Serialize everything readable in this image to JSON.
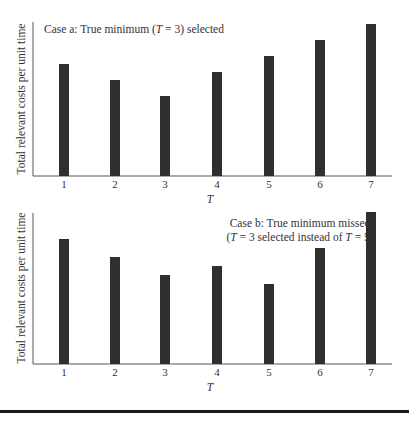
{
  "colors": {
    "bar": "#2f2f2f",
    "axis": "#555555",
    "rule": "#1a1a1a",
    "text": "#333333"
  },
  "chart_data": [
    {
      "type": "bar",
      "title": "Case a: True minimum (T = 3) selected",
      "title_lines": [
        "Case a: True minimum (T = 3) selected"
      ],
      "xlabel": "T",
      "ylabel": "Total relevant costs per unit time",
      "categories": [
        "1",
        "2",
        "3",
        "4",
        "5",
        "6",
        "7"
      ],
      "values": [
        112,
        96,
        80,
        104,
        120,
        136,
        152
      ],
      "ylim": [
        0,
        155
      ],
      "grid": false,
      "yticks": false,
      "note": "Values are relative bar heights (no y-axis scale shown); minimum at T = 3"
    },
    {
      "type": "bar",
      "title": "Case b: True minimum missed (T = 3 selected instead of T = 5)",
      "title_lines": [
        "Case b: True minimum missed",
        "(T = 3 selected instead of T = 5)"
      ],
      "xlabel": "T",
      "ylabel": "Total relevant costs per unit time",
      "categories": [
        "1",
        "2",
        "3",
        "4",
        "5",
        "6",
        "7"
      ],
      "values": [
        125,
        107,
        89,
        98,
        80,
        116,
        152
      ],
      "ylim": [
        0,
        155
      ],
      "grid": false,
      "yticks": false,
      "note": "Values are relative bar heights (no y-axis scale shown); local minimum at T = 3, true minimum at T = 5"
    }
  ]
}
